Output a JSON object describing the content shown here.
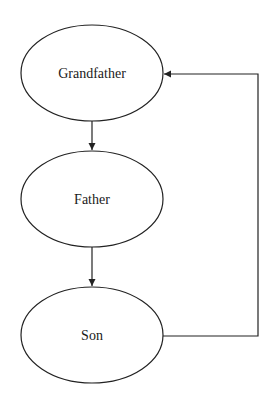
{
  "diagram": {
    "type": "flow",
    "colors": {
      "stroke": "#222222",
      "background": "#ffffff",
      "text": "#1a1a1a"
    },
    "nodes": [
      {
        "id": "grandfather",
        "label": "Grandfather",
        "shape": "ellipse"
      },
      {
        "id": "father",
        "label": "Father",
        "shape": "ellipse"
      },
      {
        "id": "son",
        "label": "Son",
        "shape": "ellipse"
      }
    ],
    "edges": [
      {
        "from": "grandfather",
        "to": "father"
      },
      {
        "from": "father",
        "to": "son"
      },
      {
        "from": "son",
        "to": "grandfather",
        "route": "right-side loop"
      }
    ]
  }
}
